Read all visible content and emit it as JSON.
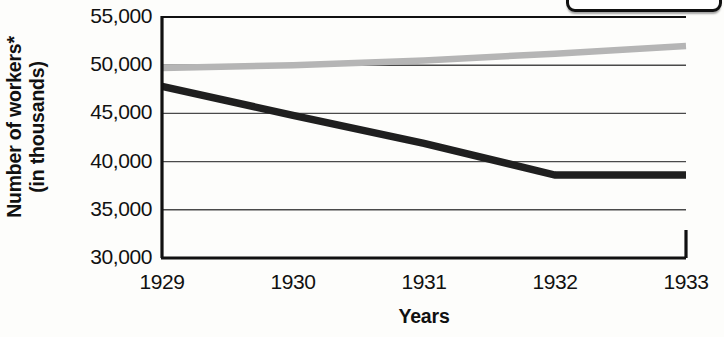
{
  "chart_data": {
    "type": "line",
    "title": "",
    "xlabel": "Years",
    "ylabel_line1": "Number of workers*",
    "ylabel_line2": "(in thousands)",
    "x": [
      1929,
      1930,
      1931,
      1932,
      1933
    ],
    "xticklabels": [
      "1929",
      "1930",
      "1931",
      "1932",
      "1933"
    ],
    "yticklabels": [
      "55,000",
      "50,000",
      "45,000",
      "40,000",
      "35,000",
      "30,000"
    ],
    "yticks": [
      55000,
      50000,
      45000,
      40000,
      35000,
      30000
    ],
    "ylim": [
      30000,
      55000
    ],
    "xlim": [
      1929,
      1933
    ],
    "grid": true,
    "legend": "",
    "legend_position": "top-right (cut off)",
    "series": [
      {
        "name": "series-light",
        "color": "#b5b5b5",
        "values": [
          49700,
          50000,
          50500,
          51200,
          52000
        ]
      },
      {
        "name": "series-dark",
        "color": "#1f1f1f",
        "values": [
          47800,
          44800,
          41900,
          38600,
          38600
        ]
      }
    ]
  },
  "axis": {
    "ylabel_line1": "Number of workers*",
    "ylabel_line2": "(in thousands)",
    "xlabel": "Years"
  },
  "yticks": {
    "t0": "55,000",
    "t1": "50,000",
    "t2": "45,000",
    "t3": "40,000",
    "t4": "35,000",
    "t5": "30,000"
  },
  "xticks": {
    "t0": "1929",
    "t1": "1930",
    "t2": "1931",
    "t3": "1932",
    "t4": "1933"
  }
}
